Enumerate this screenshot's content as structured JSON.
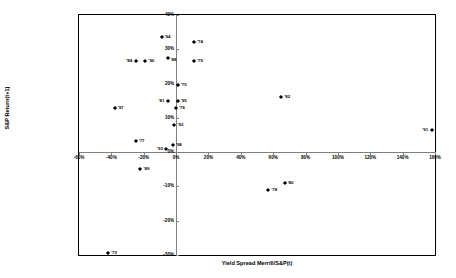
{
  "chart_data": {
    "type": "scatter",
    "title": "",
    "xlabel": "Yield Spread Merrill/S&P(t)",
    "ylabel": "S&P Return(t+1)",
    "xlim": [
      -60,
      160
    ],
    "ylim": [
      -30,
      40
    ],
    "xticks": [
      "-60%",
      "-40%",
      "-20%",
      "0%",
      "20%",
      "40%",
      "60%",
      "80%",
      "100%",
      "120%",
      "140%",
      "160%"
    ],
    "xtickvalues": [
      -60,
      -40,
      -20,
      0,
      20,
      40,
      60,
      80,
      100,
      120,
      140,
      160
    ],
    "yticks": [
      "40%",
      "30%",
      "20%",
      "10%",
      "0%",
      "-10%",
      "-20%",
      "-30%"
    ],
    "ytickvalues": [
      40,
      30,
      20,
      10,
      0,
      -10,
      -20,
      -30
    ],
    "grid": false,
    "legend": false,
    "marker": "diamond",
    "marker_color": "#000000",
    "points": [
      {
        "label": "'94",
        "x": -9,
        "y": 33.5,
        "lpos": "right"
      },
      {
        "label": "'74",
        "x": 11,
        "y": 32.0,
        "lpos": "right"
      },
      {
        "label": "'84",
        "x": -25,
        "y": 26.5,
        "lpos": "left"
      },
      {
        "label": "'90",
        "x": -19,
        "y": 26.5,
        "lpos": "right"
      },
      {
        "label": "'88",
        "x": -5,
        "y": 27.5,
        "lpos": "belowright"
      },
      {
        "label": "'79",
        "x": 11,
        "y": 26.5,
        "lpos": "right"
      },
      {
        "label": "'75",
        "x": 1,
        "y": 19.5,
        "lpos": "right"
      },
      {
        "label": "'81",
        "x": -5,
        "y": 15.0,
        "lpos": "left"
      },
      {
        "label": "'95",
        "x": 1,
        "y": 15.0,
        "lpos": "right"
      },
      {
        "label": "'82",
        "x": 65,
        "y": 16.0,
        "lpos": "right"
      },
      {
        "label": "'76",
        "x": 0,
        "y": 12.8,
        "lpos": "right"
      },
      {
        "label": "'97",
        "x": -38,
        "y": 13.0,
        "lpos": "right"
      },
      {
        "label": "'92",
        "x": -1,
        "y": 8.0,
        "lpos": "right"
      },
      {
        "label": "'77",
        "x": -25,
        "y": 3.2,
        "lpos": "right"
      },
      {
        "label": "'93",
        "x": -6,
        "y": 1.0,
        "lpos": "left"
      },
      {
        "label": "'98",
        "x": -2,
        "y": 2.0,
        "lpos": "right"
      },
      {
        "label": "'91",
        "x": 158,
        "y": 6.5,
        "lpos": "left"
      },
      {
        "label": "'89",
        "x": -22,
        "y": -5.0,
        "lpos": "right"
      },
      {
        "label": "'78",
        "x": 57,
        "y": -11.0,
        "lpos": "right"
      },
      {
        "label": "'80",
        "x": 67,
        "y": -9.0,
        "lpos": "right"
      },
      {
        "label": "'73",
        "x": -42,
        "y": -29.5,
        "lpos": "right"
      }
    ]
  }
}
